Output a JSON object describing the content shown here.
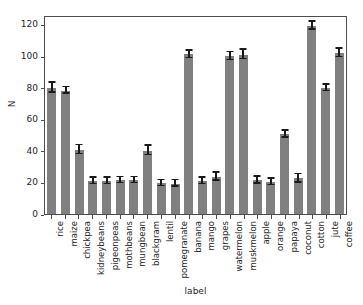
{
  "chart_data": {
    "type": "bar",
    "title": "",
    "xlabel": "label",
    "ylabel": "N",
    "ylim": [
      0,
      126
    ],
    "yticks": [
      0,
      20,
      40,
      60,
      80,
      100,
      120
    ],
    "grid": false,
    "legend": null,
    "bar_color": "#808080",
    "errorbar_color": "#1a1a1a",
    "categories": [
      "rice",
      "maize",
      "chickpea",
      "kidneybeans",
      "pigeonpeas",
      "mothbeans",
      "mungbean",
      "blackgram",
      "lentil",
      "pomegranate",
      "banana",
      "mango",
      "grapes",
      "watermelon",
      "muskmelon",
      "apple",
      "orange",
      "papaya",
      "coconut",
      "cotton",
      "jute",
      "coffee"
    ],
    "values": [
      79.9,
      78.2,
      40.7,
      20.8,
      20.9,
      21.4,
      21.4,
      40.1,
      19.5,
      19.3,
      101.0,
      20.8,
      23.6,
      99.9,
      100.9,
      21.4,
      20.3,
      50.6,
      22.5,
      119.2,
      79.8,
      101.9
    ],
    "errors": [
      3.2,
      2.2,
      2.8,
      2.1,
      2.0,
      2.0,
      2.0,
      3.0,
      2.0,
      2.0,
      2.5,
      2.1,
      2.6,
      2.6,
      3.0,
      2.1,
      2.0,
      2.2,
      2.6,
      2.4,
      2.1,
      2.6
    ]
  }
}
